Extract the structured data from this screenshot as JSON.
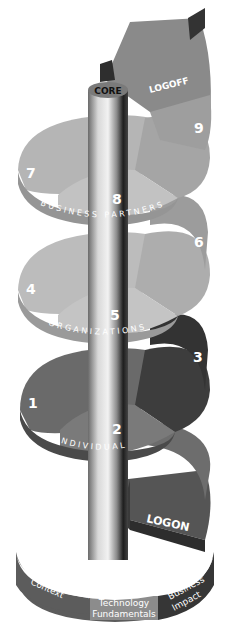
{
  "diagram": {
    "core_label": "CORE",
    "logoff_label": "LOGOFF",
    "logon_label": "LOGON",
    "levels": [
      {
        "name": "BUSINESS PARTNERS",
        "steps": [
          "7",
          "8",
          "9"
        ]
      },
      {
        "name": "ORGANIZATIONS",
        "steps": [
          "4",
          "5",
          "6"
        ]
      },
      {
        "name": "INDIVIDUAL",
        "steps": [
          "1",
          "2",
          "3"
        ]
      }
    ],
    "base": {
      "segments": [
        {
          "line1": "Organizational",
          "line2": "Context"
        },
        {
          "line1": "Technology",
          "line2": "Fundamentals"
        },
        {
          "line1": "Business",
          "line2": "Impact"
        }
      ]
    },
    "colors": {
      "top_level": "#a9a9a9",
      "middle_level": "#b3b3b3",
      "bottom_dark": "#3d3d3d",
      "bottom_mid": "#6d6d6d",
      "logoff_ramp": "#8a8a8a",
      "base_left": "#5c5c5c",
      "base_center": "#8c8c8c",
      "base_right": "#363636"
    }
  }
}
